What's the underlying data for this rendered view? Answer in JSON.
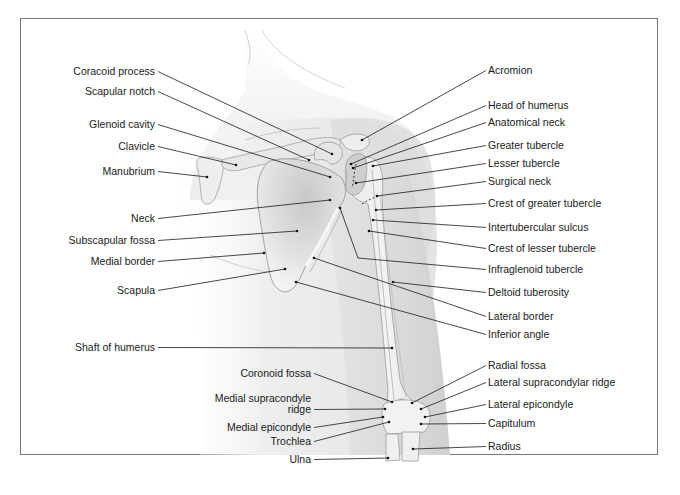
{
  "figure": {
    "frame": {
      "x": 20,
      "y": 18,
      "width": 638,
      "height": 437,
      "stroke": "#7a7a7a"
    },
    "colors": {
      "skin_light": "#f1f1f1",
      "skin_mid": "#e2e2e2",
      "skin_dark": "#cfcfcf",
      "bone": "#f4f4f4",
      "bone_shade": "#d6d6d6",
      "bone_outline": "#9a9a9a",
      "fossa": "#c4c4c4",
      "text": "#1a1a1a"
    }
  },
  "labels_left": [
    {
      "id": "coracoid-process",
      "text": "Coracoid process",
      "x": 155,
      "y": 75,
      "tx": 332,
      "ty": 154
    },
    {
      "id": "scapular-notch",
      "text": "Scapular notch",
      "x": 155,
      "y": 95,
      "tx": 309,
      "ty": 160
    },
    {
      "id": "glenoid-cavity",
      "text": "Glenoid cavity",
      "x": 155,
      "y": 128,
      "tx": 330,
      "ty": 177
    },
    {
      "id": "clavicle",
      "text": "Clavicle",
      "x": 155,
      "y": 150,
      "tx": 236,
      "ty": 165
    },
    {
      "id": "manubrium",
      "text": "Manubrium",
      "x": 155,
      "y": 175,
      "tx": 207,
      "ty": 177
    },
    {
      "id": "neck",
      "text": "Neck",
      "x": 155,
      "y": 222,
      "tx": 330,
      "ty": 200
    },
    {
      "id": "subscapular-fossa",
      "text": "Subscapular fossa",
      "x": 155,
      "y": 244,
      "tx": 297,
      "ty": 231
    },
    {
      "id": "medial-border",
      "text": "Medial border",
      "x": 155,
      "y": 265,
      "tx": 264,
      "ty": 253
    },
    {
      "id": "scapula",
      "text": "Scapula",
      "x": 155,
      "y": 294,
      "tx": 285,
      "ty": 269
    },
    {
      "id": "shaft-of-humerus",
      "text": "Shaft of humerus",
      "x": 155,
      "y": 351,
      "tx": 392,
      "ty": 348
    },
    {
      "id": "coronoid-fossa",
      "text": "Coronoid fossa",
      "x": 311,
      "y": 377,
      "tx": 392,
      "ty": 402
    },
    {
      "id": "medial-supracondyle-ridge",
      "text": "Medial supracondyle",
      "text2": "ridge",
      "x": 311,
      "y": 402,
      "y2": 413,
      "tx": 385,
      "ty": 409
    },
    {
      "id": "medial-epicondyle",
      "text": "Medial epicondyle",
      "x": 311,
      "y": 431,
      "tx": 383,
      "ty": 417
    },
    {
      "id": "trochlea",
      "text": "Trochlea",
      "x": 311,
      "y": 445,
      "tx": 389,
      "ty": 422
    },
    {
      "id": "ulna",
      "text": "Ulna",
      "x": 311,
      "y": 463,
      "tx": 388,
      "ty": 458
    }
  ],
  "labels_right": [
    {
      "id": "acromion",
      "text": "Acromion",
      "x": 488,
      "y": 74,
      "tx": 362,
      "ty": 140
    },
    {
      "id": "head-of-humerus",
      "text": "Head of humerus",
      "x": 488,
      "y": 109,
      "tx": 351,
      "ty": 164
    },
    {
      "id": "anatomical-neck",
      "text": "Anatomical neck",
      "x": 488,
      "y": 126,
      "tx": 353,
      "ty": 168
    },
    {
      "id": "greater-tubercle",
      "text": "Greater tubercle",
      "x": 488,
      "y": 149,
      "tx": 373,
      "ty": 166
    },
    {
      "id": "lesser-tubercle",
      "text": "Lesser tubercle",
      "x": 488,
      "y": 167,
      "tx": 356,
      "ty": 183
    },
    {
      "id": "surgical-neck",
      "text": "Surgical neck",
      "x": 488,
      "y": 185,
      "tx": 377,
      "ty": 196
    },
    {
      "id": "crest-of-greater-tubercle",
      "text": "Crest of greater tubercle",
      "x": 488,
      "y": 207,
      "tx": 376,
      "ty": 210
    },
    {
      "id": "intertubercular-sulcus",
      "text": "Intertubercular sulcus",
      "x": 488,
      "y": 231,
      "tx": 373,
      "ty": 220
    },
    {
      "id": "crest-of-lesser-tubercle",
      "text": "Crest of lesser tubercle",
      "x": 488,
      "y": 252,
      "tx": 369,
      "ty": 231
    },
    {
      "id": "infraglenoid-tubercle",
      "text": "Infraglenoid tubercle",
      "x": 488,
      "y": 273,
      "tx": 340,
      "ty": 208,
      "bx": 358,
      "by": 258
    },
    {
      "id": "deltoid-tuberosity",
      "text": "Deltoid tuberosity",
      "x": 488,
      "y": 296,
      "tx": 393,
      "ty": 282
    },
    {
      "id": "lateral-border",
      "text": "Lateral border",
      "x": 488,
      "y": 320,
      "tx": 314,
      "ty": 258
    },
    {
      "id": "inferior-angle",
      "text": "Inferior angle",
      "x": 488,
      "y": 338,
      "tx": 296,
      "ty": 282
    },
    {
      "id": "radial-fossa",
      "text": "Radial fossa",
      "x": 488,
      "y": 369,
      "tx": 412,
      "ty": 403
    },
    {
      "id": "lateral-supracondylar-ridge",
      "text": "Lateral supracondylar ridge",
      "x": 488,
      "y": 386,
      "tx": 421,
      "ty": 409
    },
    {
      "id": "lateral-epicondyle",
      "text": "Lateral epicondyle",
      "x": 488,
      "y": 408,
      "tx": 425,
      "ty": 417
    },
    {
      "id": "capitulum",
      "text": "Capitulum",
      "x": 488,
      "y": 427,
      "tx": 421,
      "ty": 424
    },
    {
      "id": "radius",
      "text": "Radius",
      "x": 488,
      "y": 450,
      "tx": 413,
      "ty": 449
    }
  ]
}
